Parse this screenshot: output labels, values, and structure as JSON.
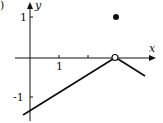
{
  "figure": {
    "panel_label": ")",
    "axes": {
      "x_label": "x",
      "y_label": "y",
      "x_ticks": [
        {
          "value": 1,
          "label": "1"
        },
        {
          "value": 2,
          "label": ""
        },
        {
          "value": 3,
          "label": ""
        }
      ],
      "y_ticks": [
        {
          "value": 1,
          "label": "1"
        },
        {
          "value": -1,
          "label": "-1"
        }
      ]
    },
    "graph": {
      "segments": [
        {
          "from": [
            -0.25,
            -1.43
          ],
          "to": [
            3,
            0
          ],
          "end": "open"
        },
        {
          "from": [
            3,
            0
          ],
          "to": [
            4,
            -0.45
          ],
          "start": "open"
        }
      ],
      "filled_point": [
        3,
        1
      ],
      "open_point": [
        3,
        0
      ]
    },
    "colors": {
      "ink": "#111111",
      "background": "#ffffff"
    }
  }
}
